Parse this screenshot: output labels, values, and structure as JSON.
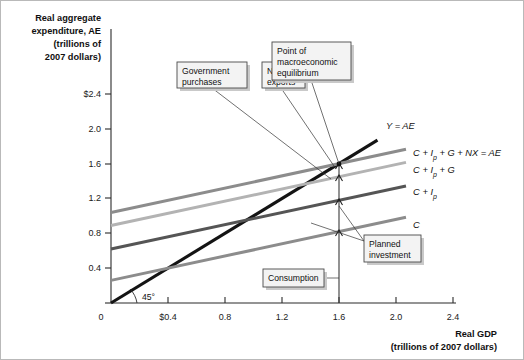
{
  "figure": {
    "background": "#ffffff",
    "border_color": "#b9b9b9"
  },
  "axes": {
    "y_title_lines": [
      "Real aggregate",
      "expenditure, AE",
      "(trillions of",
      "2007 dollars)"
    ],
    "x_title_lines": [
      "Real GDP",
      "(trillions of 2007 dollars)"
    ],
    "y_ticks": [
      "0",
      "0.4",
      "0.8",
      "1.2",
      "1.6",
      "2.0",
      "$2.4"
    ],
    "x_ticks": [
      "0",
      "$0.4",
      "0.8",
      "1.2",
      "1.6",
      "2.0",
      "2.4"
    ],
    "angle_label": "45°"
  },
  "chart_data": {
    "type": "line",
    "xlabel": "Real GDP (trillions of 2007 dollars)",
    "ylabel": "Real aggregate expenditure, AE (trillions of 2007 dollars)",
    "xlim": [
      0,
      2.4
    ],
    "ylim": [
      0,
      2.4
    ],
    "x_tick_values": [
      0,
      0.4,
      0.8,
      1.2,
      1.6,
      2.0,
      2.4
    ],
    "y_tick_values": [
      0,
      0.4,
      0.8,
      1.2,
      1.6,
      2.0,
      2.4
    ],
    "grid": false,
    "legend": "inline-right-labels",
    "series": [
      {
        "name": "Y = AE",
        "label": "Y = AE",
        "color": "#141414",
        "width": 3.1,
        "intercept": 0.0,
        "slope": 1.0,
        "x_start": 0.0,
        "x_end": 1.87,
        "label_x": 1.93,
        "label_y": 2.03
      },
      {
        "name": "C + Ip + G + NX = AE",
        "label": "C + Ip + G + NX = AE",
        "color": "#8c8c8c",
        "width": 3.0,
        "intercept": 1.04,
        "slope": 0.35,
        "x_start": 0.0,
        "x_end": 2.07,
        "label_x": 2.12,
        "label_y": 1.72
      },
      {
        "name": "C + Ip + G",
        "label": "C + Ip + G",
        "color": "#b3b3b3",
        "width": 3.0,
        "intercept": 0.89,
        "slope": 0.35,
        "x_start": 0.0,
        "x_end": 2.07,
        "label_x": 2.12,
        "label_y": 1.53
      },
      {
        "name": "C + Ip",
        "label": "C + Ip",
        "color": "#555555",
        "width": 3.0,
        "intercept": 0.62,
        "slope": 0.35,
        "x_start": 0.0,
        "x_end": 2.07,
        "label_x": 2.12,
        "label_y": 1.27
      },
      {
        "name": "C",
        "label": "C",
        "color": "#8c8c8c",
        "width": 3.0,
        "intercept": 0.26,
        "slope": 0.35,
        "x_start": 0.0,
        "x_end": 2.07,
        "label_x": 2.12,
        "label_y": 0.9
      }
    ],
    "equilibrium": {
      "x": 1.6,
      "y": 1.6,
      "label": "Point of macroeconomic equilibrium"
    },
    "decomposition_at_equilibrium": {
      "x": 1.6,
      "consumption": 0.82,
      "planned_investment": 0.36,
      "government_purchases": 0.27,
      "net_exports": 0.15,
      "total": 1.6
    }
  },
  "callouts": [
    {
      "id": "government-purchases",
      "lines": [
        "Government",
        "purchases"
      ],
      "box": {
        "x": 176,
        "y": 61,
        "w": 70,
        "h": 26
      }
    },
    {
      "id": "net-exports",
      "lines": [
        "Net",
        "exports"
      ],
      "box": {
        "x": 261,
        "y": 61,
        "w": 43,
        "h": 26
      }
    },
    {
      "id": "point-of-macroeconomic-equilibrium",
      "lines": [
        "Point of",
        "macroeconomic",
        "equilibrium"
      ],
      "box": {
        "x": 271,
        "y": 41,
        "w": 79,
        "h": 38
      }
    },
    {
      "id": "consumption",
      "lines": [
        "Consumption"
      ],
      "box": {
        "x": 262,
        "y": 268,
        "w": 61,
        "h": 18
      }
    },
    {
      "id": "planned-investment",
      "lines": [
        "Planned",
        "investment"
      ],
      "box": {
        "x": 363,
        "y": 234,
        "w": 57,
        "h": 27
      }
    }
  ],
  "curve_labels": {
    "y_ae": "Y = AE",
    "full_ae": "C + Ip + G + NX = AE",
    "cipg": "C + Ip + G",
    "cip": "C + Ip",
    "c": "C"
  }
}
